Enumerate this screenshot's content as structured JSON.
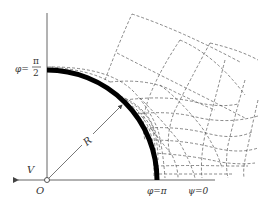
{
  "diagram": {
    "labels": {
      "phi_half_pi_prefix": "φ=",
      "phi_half_pi_num": "π",
      "phi_half_pi_den": "2",
      "phi_pi": "φ=π",
      "psi_zero": "ψ=0",
      "radius": "R",
      "velocity": "V",
      "origin": "O"
    },
    "colors": {
      "body_arc": "#000000",
      "axes": "#666666",
      "dashed_lines": "#555555",
      "text": "#333333"
    }
  }
}
